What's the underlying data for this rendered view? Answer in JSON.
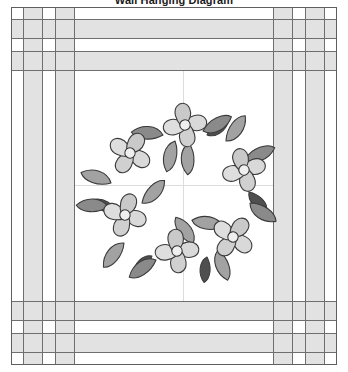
{
  "title": "Wall Hanging Diagram",
  "diagram": {
    "name": "wall-hanging-quilt",
    "center_panel": {
      "background": "#ffffff",
      "seam_lines": "cross",
      "seam_line_color": "#d8d8d8"
    },
    "border": {
      "strip_color": "#e2e2e2",
      "background_color": "#ffffff",
      "seam_color": "#6e6e6e",
      "corner_block": "nine-patch-checkerboard"
    },
    "outline_color": "#5f5f5f"
  },
  "wreath": {
    "flower_count": 6,
    "petals_per_flower": 4,
    "flower_petal_color": "#d9d9d9",
    "flower_petal_shade": "#c4c4c4",
    "flower_center_color": "#ededed",
    "leaf_dark_color": "#8a8a8a",
    "leaf_darker_color": "#4a4a4a",
    "leaf_mid_color": "#9e9e9e",
    "outline_color": "#3a3a3a",
    "flowers": [
      {
        "label": "flower-top",
        "cx": 174,
        "cy": 118,
        "angle": -90
      },
      {
        "label": "flower-upper-left",
        "cx": 120,
        "cy": 147,
        "angle": -150
      },
      {
        "label": "flower-upper-right",
        "cx": 232,
        "cy": 163,
        "angle": -25
      },
      {
        "label": "flower-lower-left",
        "cx": 115,
        "cy": 208,
        "angle": 150
      },
      {
        "label": "flower-lower-right",
        "cx": 221,
        "cy": 229,
        "angle": 40
      },
      {
        "label": "flower-bottom",
        "cx": 166,
        "cy": 243,
        "angle": 95
      }
    ],
    "leaves": [
      {
        "label": "leaf-top-left",
        "cx": 144,
        "cy": 122,
        "angle": 205,
        "tone": "dark"
      },
      {
        "label": "leaf-top-right",
        "cx": 204,
        "cy": 128,
        "angle": 330,
        "tone": "dark"
      },
      {
        "label": "leaf-right-upper",
        "cx": 232,
        "cy": 140,
        "angle": 300,
        "tone": "mid"
      },
      {
        "label": "leaf-right-lower",
        "cx": 240,
        "cy": 200,
        "angle": 30,
        "tone": "dark"
      },
      {
        "label": "leaf-bottom-right",
        "cx": 206,
        "cy": 248,
        "angle": 70,
        "tone": "mid"
      },
      {
        "label": "leaf-bottom-left",
        "cx": 140,
        "cy": 247,
        "angle": 120,
        "tone": "dark"
      },
      {
        "label": "leaf-left-lower",
        "cx": 105,
        "cy": 234,
        "angle": 145,
        "tone": "mid"
      },
      {
        "label": "leaf-left-upper",
        "cx": 99,
        "cy": 175,
        "angle": 200,
        "tone": "mid"
      },
      {
        "label": "leaf-inner-upper",
        "cx": 169,
        "cy": 152,
        "angle": 250,
        "tone": "mid"
      },
      {
        "label": "leaf-inner-left",
        "cx": 146,
        "cy": 190,
        "angle": 20,
        "tone": "mid"
      },
      {
        "label": "leaf-inner-right",
        "cx": 200,
        "cy": 215,
        "angle": 205,
        "tone": "mid"
      }
    ]
  }
}
